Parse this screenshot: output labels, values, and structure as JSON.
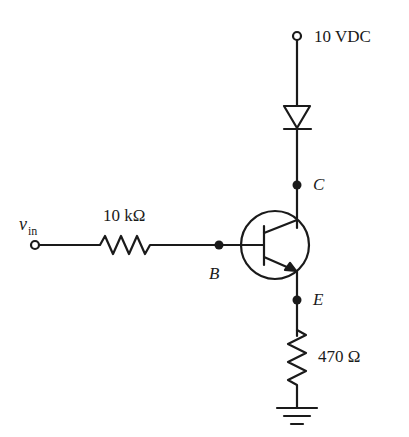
{
  "diagram": {
    "type": "BJT common-emitter switch circuit",
    "supply": {
      "label": "10 VDC"
    },
    "input": {
      "label": "v",
      "subscript": "in"
    },
    "base_resistor": {
      "label": "10 kΩ"
    },
    "emitter_resistor": {
      "label": "470 Ω"
    },
    "nodes": {
      "collector": "C",
      "base": "B",
      "emitter": "E"
    },
    "components": [
      "supply terminal",
      "diode",
      "NPN transistor",
      "base resistor",
      "emitter resistor",
      "ground"
    ],
    "colors": {
      "line": "#1a1a1a",
      "background": "#ffffff"
    }
  }
}
